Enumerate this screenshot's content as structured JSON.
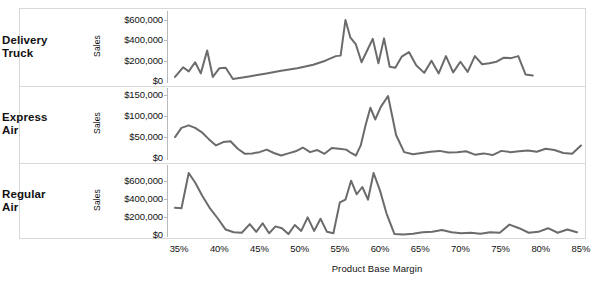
{
  "chart_data": {
    "type": "line",
    "title": "",
    "subtitle": "",
    "layout": "small-multiples, 3 stacked panels sharing one x axis",
    "xlabel": "Product Base Margin",
    "ylabel": "Sales",
    "xlim": [
      0.335,
      0.855
    ],
    "xticks": [
      0.35,
      0.4,
      0.45,
      0.5,
      0.55,
      0.6,
      0.65,
      0.7,
      0.75,
      0.8,
      0.85
    ],
    "xticklabels": [
      "35%",
      "40%",
      "45%",
      "50%",
      "55%",
      "60%",
      "65%",
      "70%",
      "75%",
      "80%",
      "85%"
    ],
    "grid": false,
    "legend": "none (row labels at left)",
    "line_color": "#6b6b6b",
    "line_width": 2,
    "panels": [
      {
        "name": "Delivery Truck",
        "label_lines": [
          "Delivery",
          "Truck"
        ],
        "ylabel": "Sales",
        "ylim": [
          0,
          660000
        ],
        "yticks": [
          0,
          200000,
          400000,
          600000
        ],
        "yticklabels": [
          "$0",
          "$200,000",
          "$400,000",
          "$600,000"
        ],
        "x": [
          0.345,
          0.355,
          0.362,
          0.37,
          0.377,
          0.385,
          0.392,
          0.4,
          0.408,
          0.417,
          0.437,
          0.457,
          0.477,
          0.497,
          0.517,
          0.532,
          0.545,
          0.551,
          0.557,
          0.563,
          0.57,
          0.577,
          0.584,
          0.591,
          0.598,
          0.605,
          0.612,
          0.619,
          0.627,
          0.636,
          0.645,
          0.655,
          0.664,
          0.673,
          0.682,
          0.691,
          0.7,
          0.709,
          0.718,
          0.727,
          0.736,
          0.745,
          0.754,
          0.763,
          0.772,
          0.781,
          0.79
        ],
        "values": [
          40000,
          135000,
          95000,
          185000,
          75000,
          300000,
          40000,
          125000,
          130000,
          20000,
          45000,
          72000,
          100000,
          125000,
          160000,
          200000,
          245000,
          250000,
          600000,
          430000,
          360000,
          185000,
          300000,
          415000,
          175000,
          420000,
          140000,
          130000,
          240000,
          285000,
          155000,
          80000,
          200000,
          75000,
          245000,
          85000,
          190000,
          90000,
          245000,
          165000,
          175000,
          190000,
          230000,
          225000,
          245000,
          65000,
          55000
        ]
      },
      {
        "name": "Express Air",
        "label_lines": [
          "Express",
          "Air"
        ],
        "ylabel": "Sales",
        "ylim": [
          0,
          160000
        ],
        "yticks": [
          0,
          50000,
          100000,
          150000
        ],
        "yticklabels": [
          "$0",
          "$50,000",
          "$100,000",
          "$150,000"
        ],
        "x": [
          0.345,
          0.353,
          0.362,
          0.37,
          0.378,
          0.387,
          0.396,
          0.405,
          0.414,
          0.423,
          0.432,
          0.441,
          0.45,
          0.459,
          0.468,
          0.477,
          0.486,
          0.495,
          0.504,
          0.513,
          0.522,
          0.531,
          0.54,
          0.549,
          0.558,
          0.564,
          0.57,
          0.576,
          0.582,
          0.588,
          0.594,
          0.601,
          0.61,
          0.62,
          0.63,
          0.641,
          0.652,
          0.663,
          0.674,
          0.685,
          0.696,
          0.707,
          0.718,
          0.729,
          0.74,
          0.751,
          0.762,
          0.773,
          0.784,
          0.795,
          0.806,
          0.817,
          0.828,
          0.839,
          0.85
        ],
        "values": [
          50000,
          72000,
          78000,
          72000,
          62000,
          45000,
          30000,
          38000,
          40000,
          22000,
          10000,
          11000,
          14000,
          20000,
          12000,
          6000,
          11000,
          16000,
          25000,
          14000,
          19000,
          10000,
          24000,
          22000,
          20000,
          12000,
          6000,
          30000,
          78000,
          120000,
          92000,
          122000,
          148000,
          55000,
          14000,
          9000,
          12000,
          15000,
          17000,
          13000,
          14000,
          16000,
          8000,
          11000,
          7000,
          17000,
          14000,
          16000,
          18000,
          15000,
          22000,
          19000,
          12000,
          10000,
          30000
        ]
      },
      {
        "name": "Regular Air",
        "label_lines": [
          "Regular",
          "Air"
        ],
        "ylabel": "Sales",
        "ylim": [
          0,
          740000
        ],
        "yticks": [
          0,
          200000,
          400000,
          600000
        ],
        "yticklabels": [
          "$0",
          "$200,000",
          "$400,000",
          "$600,000"
        ],
        "x": [
          0.345,
          0.353,
          0.362,
          0.37,
          0.379,
          0.388,
          0.398,
          0.408,
          0.418,
          0.428,
          0.438,
          0.446,
          0.454,
          0.462,
          0.47,
          0.478,
          0.486,
          0.494,
          0.502,
          0.51,
          0.518,
          0.526,
          0.534,
          0.542,
          0.55,
          0.557,
          0.564,
          0.571,
          0.578,
          0.585,
          0.592,
          0.6,
          0.608,
          0.618,
          0.629,
          0.641,
          0.653,
          0.665,
          0.677,
          0.689,
          0.701,
          0.713,
          0.725,
          0.737,
          0.749,
          0.761,
          0.773,
          0.785,
          0.797,
          0.809,
          0.821,
          0.833,
          0.845
        ],
        "values": [
          300000,
          295000,
          685000,
          580000,
          430000,
          300000,
          185000,
          60000,
          30000,
          25000,
          120000,
          35000,
          130000,
          20000,
          95000,
          75000,
          10000,
          110000,
          45000,
          195000,
          45000,
          180000,
          35000,
          20000,
          360000,
          390000,
          600000,
          450000,
          530000,
          390000,
          685000,
          490000,
          240000,
          10000,
          5000,
          15000,
          30000,
          35000,
          55000,
          30000,
          20000,
          25000,
          15000,
          30000,
          25000,
          115000,
          75000,
          25000,
          35000,
          75000,
          25000,
          60000,
          30000
        ]
      }
    ]
  },
  "axis": {
    "y_title": "Sales",
    "x_title": "Product Base Margin"
  },
  "colors": {
    "line": "#6b6b6b",
    "frame": "#d8d8d8",
    "tick": "#b9b9b9",
    "text": "#111111",
    "background": "#ffffff"
  }
}
